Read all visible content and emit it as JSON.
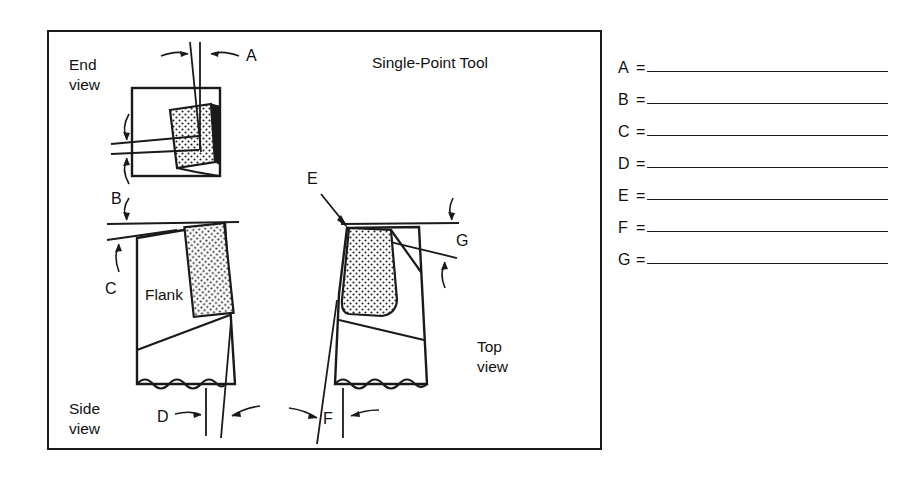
{
  "figure": {
    "title": "Single-Point Tool",
    "view_labels": {
      "end_view_line1": "End",
      "end_view_line2": "view",
      "side_view_line1": "Side",
      "side_view_line2": "view",
      "top_view_line1": "Top",
      "top_view_line2": "view"
    },
    "part_label": "Flank",
    "callouts": [
      {
        "id": "A",
        "letter": "A",
        "view": "end view",
        "describes": "angle between vertical reference line and tool edge line (back rake / side rake indicator)"
      },
      {
        "id": "B",
        "letter": "B",
        "view": "end view",
        "describes": "angle between two near-horizontal reference lines at left of end view"
      },
      {
        "id": "C",
        "letter": "C",
        "view": "side view",
        "describes": "angle between horizontal reference line and top face of tool"
      },
      {
        "id": "D",
        "letter": "D",
        "view": "side view",
        "describes": "angle between vertical reference line and flank line at bottom of side view"
      },
      {
        "id": "E",
        "letter": "E",
        "view": "top view",
        "describes": "arrow pointing to the tool nose / insert corner"
      },
      {
        "id": "F",
        "letter": "F",
        "view": "top view",
        "describes": "angle between vertical reference line and tool side at bottom of top view"
      },
      {
        "id": "G",
        "letter": "G",
        "view": "top view",
        "describes": "angle between horizontal reference line and cutting edge line at right of top view"
      }
    ]
  },
  "answer_key": {
    "equals_sign": "=",
    "rows": [
      {
        "letter": "A",
        "value": ""
      },
      {
        "letter": "B",
        "value": ""
      },
      {
        "letter": "C",
        "value": ""
      },
      {
        "letter": "D",
        "value": ""
      },
      {
        "letter": "E",
        "value": ""
      },
      {
        "letter": "F",
        "value": ""
      },
      {
        "letter": "G",
        "value": ""
      }
    ]
  },
  "colors": {
    "ink": "#1a1a1a",
    "paper": "#ffffff",
    "stipple": "#222222"
  }
}
